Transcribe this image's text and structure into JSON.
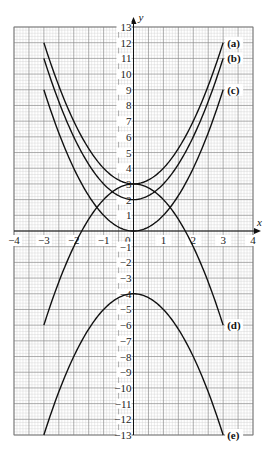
{
  "chart_data": {
    "type": "line",
    "title": "",
    "xlabel": "x",
    "ylabel": "y",
    "xlim": [
      -4,
      4
    ],
    "ylim": [
      -13,
      13
    ],
    "grid": true,
    "legend": "inline labels at right end of curves",
    "x_ticks": [
      -4,
      -3,
      -2,
      -1,
      0,
      1,
      2,
      3,
      4
    ],
    "y_ticks": [
      -13,
      -12,
      -11,
      -10,
      -9,
      -8,
      -7,
      -6,
      -5,
      -4,
      -3,
      -2,
      -1,
      1,
      2,
      3,
      4,
      5,
      6,
      7,
      8,
      9,
      10,
      11,
      12,
      13
    ],
    "origin_label": "0",
    "series": [
      {
        "name": "(a)",
        "equation": "y = x^2 + 3",
        "x": [
          -3,
          -2,
          -1,
          0,
          1,
          2,
          3
        ],
        "values": [
          12,
          7,
          4,
          3,
          4,
          7,
          12
        ]
      },
      {
        "name": "(b)",
        "equation": "y = x^2 + 2",
        "x": [
          -3,
          -2,
          -1,
          0,
          1,
          2,
          3
        ],
        "values": [
          11,
          6,
          3,
          2,
          3,
          6,
          11
        ]
      },
      {
        "name": "(c)",
        "equation": "y = x^2",
        "x": [
          -3,
          -2,
          -1,
          0,
          1,
          2,
          3
        ],
        "values": [
          9,
          4,
          1,
          0,
          1,
          4,
          9
        ]
      },
      {
        "name": "(d)",
        "equation": "y = 3 - x^2",
        "x": [
          -3,
          -2,
          -1,
          0,
          1,
          2,
          3
        ],
        "values": [
          -6,
          -1,
          2,
          3,
          2,
          -1,
          -6
        ]
      },
      {
        "name": "(e)",
        "equation": "y = -x^2 - 4",
        "x": [
          -3,
          -2,
          -1,
          0,
          1,
          2,
          3
        ],
        "values": [
          -13,
          -8,
          -5,
          -4,
          -5,
          -8,
          -13
        ]
      }
    ]
  },
  "colors": {
    "curve": "#111111",
    "grid_major": "#8a8a8a",
    "grid_minor": "#cfcfcf",
    "axis": "#111111"
  }
}
